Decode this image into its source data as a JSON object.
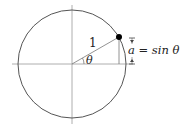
{
  "diagram": {
    "radius_label": "1",
    "angle_label": "θ",
    "height_label": "a = sin θ",
    "colors": {
      "stroke": "#444444",
      "axis": "#888888",
      "point": "#000000"
    },
    "geometry": {
      "center": [
        72,
        64
      ],
      "radius": 54,
      "point": [
        119,
        37
      ]
    }
  }
}
